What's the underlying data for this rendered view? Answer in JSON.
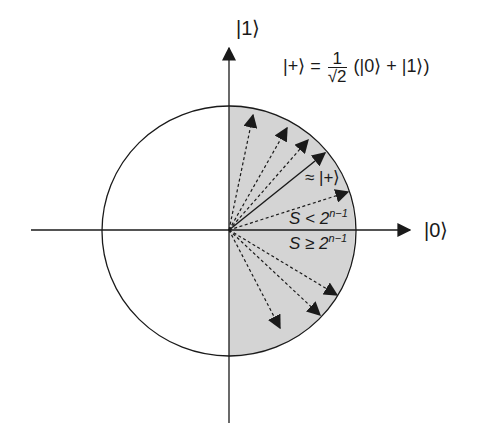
{
  "diagram": {
    "type": "qubit-state-circle",
    "axes": {
      "horizontal_label": "|0⟩",
      "vertical_label": "|1⟩"
    },
    "equation": {
      "lhs": "|+⟩ =",
      "fraction_numerator": "1",
      "fraction_denominator": "√2",
      "rhs": "(|0⟩ + |1⟩)"
    },
    "labels": {
      "approx_plus": "≈ |+⟩",
      "s_less_prefix": "S < 2",
      "s_less_exp": "n−1",
      "s_geq_prefix": "S ≥ 2",
      "s_geq_exp": "n−1"
    },
    "colors": {
      "shaded_region": "#d4d4d4",
      "stroke": "#1a1a1a",
      "background": "#ffffff"
    },
    "vectors": [
      {
        "name": "dashed-1",
        "style": "dashed",
        "tip": [
          253,
          115
        ]
      },
      {
        "name": "dashed-2",
        "style": "dashed",
        "tip": [
          287,
          128
        ]
      },
      {
        "name": "dashed-3",
        "style": "dashed",
        "tip": [
          308,
          140
        ]
      },
      {
        "name": "solid-plus",
        "style": "solid",
        "tip": [
          325,
          153
        ]
      },
      {
        "name": "dashed-4",
        "style": "dashed",
        "tip": [
          348,
          192
        ]
      },
      {
        "name": "dashed-5",
        "style": "dashed",
        "tip": [
          337,
          295
        ]
      },
      {
        "name": "dashed-6",
        "style": "dashed",
        "tip": [
          320,
          315
        ]
      },
      {
        "name": "dashed-7",
        "style": "dashed",
        "tip": [
          280,
          328
        ]
      }
    ]
  }
}
